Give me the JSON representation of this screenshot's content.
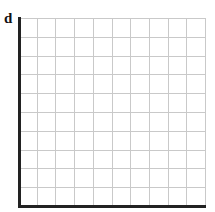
{
  "panel_label": "d",
  "chart_data": {
    "type": "line",
    "title": "",
    "panel_label": "d",
    "xlabel": "",
    "ylabel": "",
    "series": [],
    "grid": true,
    "grid_columns": 10,
    "grid_rows": 10,
    "axis_ticks": "none",
    "legend": "none",
    "colors": {
      "axis": "#222222",
      "grid": "#c9c9c9",
      "background": "#ffffff"
    }
  }
}
